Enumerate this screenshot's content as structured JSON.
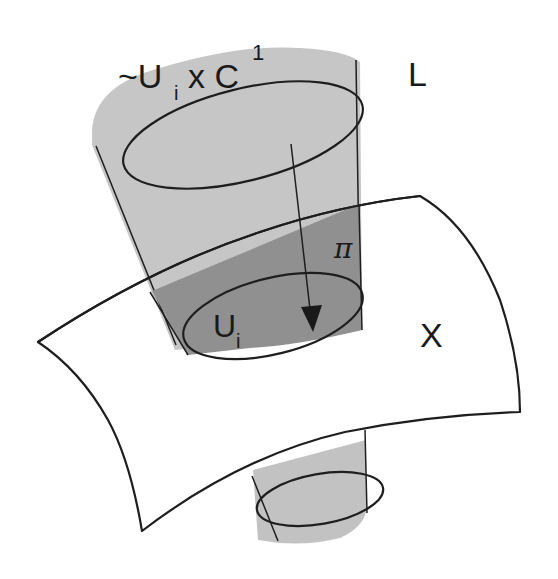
{
  "figure": {
    "labels": {
      "trivialization": "~U",
      "trivialization_sub": "i",
      "trivialization_times": "x C",
      "trivialization_sup": "1",
      "bundle": "L",
      "projection": "π",
      "open_set": "U",
      "open_set_sub": "i",
      "base_space": "X"
    },
    "colors": {
      "cylinder_light": "#c4c4c4",
      "cylinder_mid": "#adadad",
      "surface": "#a9a9a9",
      "overlap": "#8e8e8e",
      "open_set_fill": "#7f7f7f",
      "stroke": "#1e1e1e",
      "background": "#ffffff"
    }
  }
}
